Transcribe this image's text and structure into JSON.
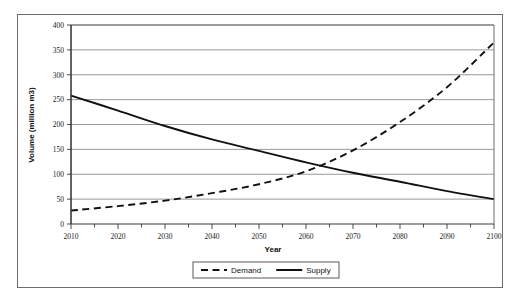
{
  "chart_data": {
    "type": "line",
    "title": "",
    "xlabel": "Year",
    "ylabel": "Volume (million m3)",
    "xlim": [
      2010,
      2100
    ],
    "ylim": [
      0,
      400
    ],
    "ytick_step": 50,
    "xtick_step": 10,
    "xminor_step": 5,
    "grid": "horizontal",
    "legend_position": "bottom-center",
    "x": [
      2010,
      2020,
      2030,
      2040,
      2050,
      2060,
      2070,
      2080,
      2090,
      2100
    ],
    "xtick_labels": [
      "2010",
      "2020",
      "2030",
      "2040",
      "2050",
      "2060",
      "2070",
      "2080",
      "2090",
      "2100"
    ],
    "ytick_labels": [
      "0",
      "50",
      "100",
      "150",
      "200",
      "250",
      "300",
      "350",
      "400"
    ],
    "series": [
      {
        "name": "Demand",
        "style": "dashed",
        "color": "#111111",
        "values": [
          27,
          36,
          47,
          62,
          80,
          106,
          148,
          205,
          275,
          365
        ]
      },
      {
        "name": "Supply",
        "style": "solid",
        "color": "#111111",
        "values": [
          258,
          228,
          197,
          170,
          147,
          124,
          103,
          85,
          66,
          50
        ]
      }
    ],
    "annotations": [
      {
        "text": "Demand and Supply curves intersect near year 2057 at about 100 million m3",
        "x": 2057,
        "y": 100
      }
    ]
  },
  "axes": {
    "x_title": "Year",
    "y_title": "Volume (million m3)"
  },
  "legend": {
    "items": [
      {
        "label": "Demand",
        "style": "dashed"
      },
      {
        "label": "Supply",
        "style": "solid"
      }
    ]
  },
  "colors": {
    "line": "#111111",
    "grid": "#808080",
    "axis": "#4d4d4d",
    "frame": "#6d6d6d",
    "background": "#ffffff"
  }
}
